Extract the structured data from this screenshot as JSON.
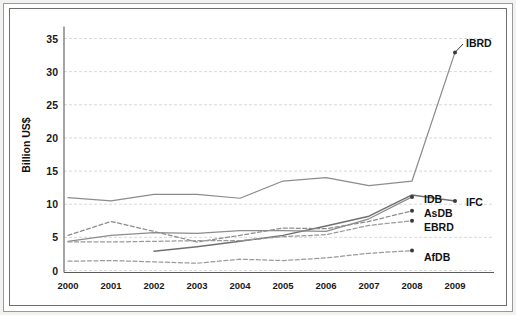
{
  "chart_data": {
    "type": "line",
    "title": "",
    "xlabel": "",
    "ylabel": "Billion US$",
    "x": [
      "2000",
      "2001",
      "2002",
      "2003",
      "2004",
      "2005",
      "2006",
      "2007",
      "2008",
      "2009"
    ],
    "categories": [
      "2000",
      "2001",
      "2002",
      "2003",
      "2004",
      "2005",
      "2006",
      "2007",
      "2008",
      "2009"
    ],
    "ylim": [
      0,
      37
    ],
    "yticks": [
      0,
      5,
      10,
      15,
      20,
      25,
      30,
      35
    ],
    "ytick_labels": [
      "0",
      "5",
      "10",
      "15",
      "20",
      "25",
      "30",
      "35"
    ],
    "grid": true,
    "legend_position": "inline-right-labels",
    "series": [
      {
        "name": "IBRD",
        "label": "IBRD",
        "style": "solid",
        "color": "#8c8c8c",
        "x": [
          "2000",
          "2001",
          "2002",
          "2003",
          "2004",
          "2005",
          "2006",
          "2007",
          "2008",
          "2009"
        ],
        "values": [
          11.0,
          10.5,
          11.5,
          11.5,
          10.9,
          13.5,
          14.0,
          12.8,
          13.5,
          32.9
        ]
      },
      {
        "name": "IFC",
        "label": "IFC",
        "style": "solid",
        "color": "#707070",
        "x": [
          "2002",
          "2003",
          "2004",
          "2005",
          "2006",
          "2007",
          "2008",
          "2009"
        ],
        "values": [
          2.9,
          3.6,
          4.4,
          5.3,
          6.7,
          8.2,
          11.4,
          10.5
        ]
      },
      {
        "name": "IDB",
        "label": "IDB",
        "style": "solid",
        "color": "#8c8c8c",
        "x": [
          "2000",
          "2001",
          "2002",
          "2003",
          "2004",
          "2005",
          "2006",
          "2007",
          "2008",
          "2009"
        ],
        "values": [
          4.4,
          5.3,
          5.7,
          5.6,
          6.0,
          6.0,
          5.9,
          7.8,
          11.1,
          null
        ]
      },
      {
        "name": "AsDB",
        "label": "AsDB",
        "style": "dashed",
        "color": "#8c8c8c",
        "x": [
          "2000",
          "2001",
          "2002",
          "2003",
          "2004",
          "2005",
          "2006",
          "2007",
          "2008",
          "2009"
        ],
        "values": [
          5.3,
          7.4,
          5.9,
          4.3,
          5.3,
          6.4,
          6.3,
          7.4,
          9.0,
          null
        ]
      },
      {
        "name": "EBRD",
        "label": "EBRD",
        "style": "dashed",
        "color": "#9a9a9a",
        "x": [
          "2000",
          "2001",
          "2002",
          "2003",
          "2004",
          "2005",
          "2006",
          "2007",
          "2008",
          "2009"
        ],
        "values": [
          4.3,
          4.3,
          4.4,
          4.5,
          4.5,
          5.1,
          5.4,
          6.8,
          7.5,
          null
        ]
      },
      {
        "name": "AfDB",
        "label": "AfDB",
        "style": "dashed",
        "color": "#9a9a9a",
        "x": [
          "2000",
          "2001",
          "2002",
          "2003",
          "2004",
          "2005",
          "2006",
          "2007",
          "2008",
          "2009"
        ],
        "values": [
          1.4,
          1.5,
          1.3,
          1.1,
          1.7,
          1.5,
          1.9,
          2.6,
          3.0,
          null
        ]
      }
    ],
    "annotations": [
      {
        "text": "IBRD",
        "x": "2009",
        "y": 32.9
      },
      {
        "text": "IFC",
        "x": "2009",
        "y": 10.5
      },
      {
        "text": "IDB",
        "x": "2008",
        "y": 11.1
      },
      {
        "text": "AsDB",
        "x": "2008",
        "y": 9.0
      },
      {
        "text": "EBRD",
        "x": "2008",
        "y": 7.5
      },
      {
        "text": "AfDB",
        "x": "2008",
        "y": 3.0
      }
    ]
  }
}
